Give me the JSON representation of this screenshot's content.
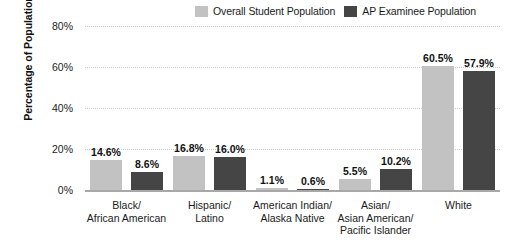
{
  "chart_data": {
    "type": "bar",
    "title": "",
    "xlabel": "",
    "ylabel": "Percentage of Population",
    "ylim": [
      0,
      80
    ],
    "yticks": [
      "0%",
      "20%",
      "40%",
      "60%",
      "80%"
    ],
    "ytick_values": [
      0,
      20,
      40,
      60,
      80
    ],
    "grid": true,
    "legend_position": "top-right",
    "categories": [
      "Black/\nAfrican American",
      "Hispanic/\nLatino",
      "American Indian/\nAlaska Native",
      "Asian/\nAsian American/\nPacific Islander",
      "White"
    ],
    "series": [
      {
        "name": "Overall Student Population",
        "color": "#c2c2c2",
        "values": [
          14.6,
          16.8,
          1.1,
          5.5,
          60.5
        ],
        "labels": [
          "14.6%",
          "16.8%",
          "1.1%",
          "5.5%",
          "60.5%"
        ]
      },
      {
        "name": "AP Examinee Population",
        "color": "#454545",
        "values": [
          8.6,
          16.0,
          0.6,
          10.2,
          57.9
        ],
        "labels": [
          "8.6%",
          "16.0%",
          "0.6%",
          "10.2%",
          "57.9%"
        ]
      }
    ]
  },
  "legend": {
    "entries": [
      {
        "label": "Overall Student Population",
        "color": "#c2c2c2"
      },
      {
        "label": "AP Examinee Population",
        "color": "#454545"
      }
    ]
  },
  "axis": {
    "y_title": "Percentage of Population"
  }
}
